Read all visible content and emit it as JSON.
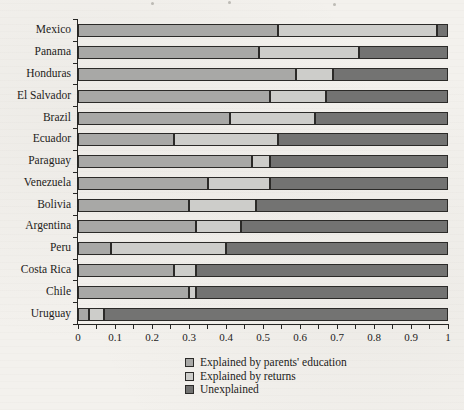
{
  "figure": {
    "background_color": "#f3f1ed",
    "axis_color": "#262624",
    "text_color": "#1d1c1a"
  },
  "chart_data": {
    "type": "bar",
    "orientation": "horizontal",
    "stacked": true,
    "title": "",
    "xlabel": "",
    "ylabel": "",
    "xlim": [
      0,
      1
    ],
    "x_tick_values": [
      0,
      0.1,
      0.2,
      0.3,
      0.4,
      0.5,
      0.6,
      0.7,
      0.8,
      0.9,
      1
    ],
    "x_tick_labels": [
      "0",
      "0.1",
      "0.2",
      "0.3",
      "0.4",
      "0.5",
      "0.6",
      "0.7",
      "0.8",
      "0.9",
      "1"
    ],
    "x_minor_tick_step": 0.05,
    "grid": false,
    "legend_position": "bottom",
    "categories": [
      "Mexico",
      "Panama",
      "Honduras",
      "El Salvador",
      "Brazil",
      "Ecuador",
      "Paraguay",
      "Venezuela",
      "Bolivia",
      "Argentina",
      "Peru",
      "Costa Rica",
      "Chile",
      "Uruguay"
    ],
    "series": [
      {
        "name": "Explained by parents' education",
        "color": "#a8a8a6",
        "values": [
          0.54,
          0.49,
          0.59,
          0.52,
          0.41,
          0.26,
          0.47,
          0.35,
          0.3,
          0.32,
          0.09,
          0.26,
          0.3,
          0.03
        ]
      },
      {
        "name": "Explained by returns",
        "color": "#cdcdca",
        "values": [
          0.43,
          0.27,
          0.1,
          0.15,
          0.23,
          0.28,
          0.05,
          0.17,
          0.18,
          0.12,
          0.31,
          0.06,
          0.02,
          0.04
        ]
      },
      {
        "name": "Unexplained",
        "color": "#737372",
        "values": [
          0.03,
          0.24,
          0.31,
          0.33,
          0.36,
          0.46,
          0.48,
          0.48,
          0.52,
          0.56,
          0.6,
          0.68,
          0.68,
          0.93
        ]
      }
    ]
  }
}
